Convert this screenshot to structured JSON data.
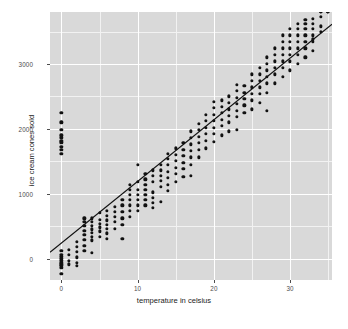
{
  "chart_data": {
    "type": "scatter",
    "title": "",
    "xlabel": "temperature in celsius",
    "ylabel": "ice cream cones sold",
    "xlim": [
      -1.5,
      35.5
    ],
    "ylim": [
      -330,
      3800
    ],
    "xticks": [
      0,
      10,
      20,
      30
    ],
    "xticklabels": [
      "0",
      "10",
      "20",
      "30"
    ],
    "yticks": [
      0,
      1000,
      2000,
      3000
    ],
    "yticklabels": [
      "0",
      "1000",
      "2000",
      "3000"
    ],
    "grid": true,
    "grid_color": "#ffffff",
    "panel_color": "#d9d9d9",
    "point_color": "#111111",
    "legend": "none",
    "fit_line": {
      "type": "linear",
      "color": "#111111",
      "slope": 95,
      "intercept": 240,
      "x_start": -1.5,
      "x_end": 35.5,
      "y_start": 98,
      "y_end": 3612
    },
    "x": [
      0,
      0,
      0,
      0,
      0,
      0,
      0,
      0,
      0,
      0,
      0,
      0,
      0,
      0,
      0,
      0,
      0,
      0,
      0,
      0,
      1,
      1,
      1,
      1,
      2,
      2,
      2,
      2,
      2,
      2,
      3,
      3,
      3,
      3,
      3,
      3,
      3,
      3,
      4,
      4,
      4,
      4,
      4,
      4,
      4,
      4,
      5,
      5,
      5,
      5,
      5,
      5,
      6,
      6,
      6,
      6,
      6,
      6,
      6,
      7,
      7,
      7,
      7,
      7,
      8,
      8,
      8,
      8,
      8,
      8,
      9,
      9,
      9,
      9,
      9,
      9,
      9,
      10,
      10,
      10,
      10,
      10,
      10,
      10,
      11,
      11,
      11,
      11,
      11,
      11,
      11,
      12,
      12,
      12,
      12,
      12,
      12,
      12,
      13,
      13,
      13,
      13,
      13,
      13,
      14,
      14,
      14,
      14,
      14,
      14,
      14,
      15,
      15,
      15,
      15,
      15,
      15,
      16,
      16,
      16,
      16,
      16,
      16,
      17,
      17,
      17,
      17,
      17,
      17,
      17,
      18,
      18,
      18,
      18,
      18,
      18,
      19,
      19,
      19,
      19,
      19,
      19,
      20,
      20,
      20,
      20,
      20,
      20,
      20,
      21,
      21,
      21,
      21,
      21,
      21,
      22,
      22,
      22,
      22,
      22,
      22,
      23,
      23,
      23,
      23,
      23,
      23,
      23,
      24,
      24,
      24,
      24,
      24,
      25,
      25,
      25,
      25,
      25,
      25,
      26,
      26,
      26,
      26,
      26,
      26,
      27,
      27,
      27,
      27,
      27,
      27,
      27,
      28,
      28,
      28,
      28,
      28,
      28,
      29,
      29,
      29,
      29,
      29,
      29,
      29,
      30,
      30,
      30,
      30,
      30,
      30,
      30,
      31,
      31,
      31,
      31,
      31,
      31,
      31,
      32,
      32,
      32,
      32,
      32,
      32,
      32,
      33,
      33,
      33,
      33,
      33,
      33,
      33,
      34,
      34,
      34,
      34,
      34,
      34,
      35,
      35,
      35,
      35
    ],
    "y": [
      -230,
      -140,
      -110,
      -90,
      -60,
      -30,
      0,
      30,
      60,
      120,
      1620,
      1680,
      1720,
      1790,
      1820,
      1860,
      1900,
      1980,
      2100,
      2250,
      -90,
      -30,
      60,
      140,
      -110,
      -60,
      20,
      100,
      180,
      260,
      120,
      200,
      290,
      360,
      430,
      500,
      560,
      620,
      90,
      280,
      340,
      400,
      450,
      510,
      560,
      620,
      340,
      420,
      480,
      540,
      600,
      700,
      300,
      390,
      460,
      520,
      590,
      660,
      740,
      460,
      560,
      640,
      720,
      800,
      300,
      520,
      620,
      720,
      820,
      900,
      640,
      740,
      820,
      900,
      980,
      1060,
      1140,
      730,
      820,
      900,
      980,
      1060,
      1180,
      1450,
      820,
      900,
      980,
      1060,
      1140,
      1220,
      1300,
      780,
      860,
      940,
      1020,
      1180,
      1280,
      1360,
      870,
      1100,
      1200,
      1280,
      1360,
      1440,
      1040,
      1140,
      1240,
      1340,
      1440,
      1540,
      1620,
      1180,
      1300,
      1400,
      1500,
      1600,
      1700,
      1260,
      1380,
      1480,
      1580,
      1680,
      1780,
      1280,
      1440,
      1560,
      1660,
      1760,
      1860,
      1960,
      1560,
      1680,
      1780,
      1880,
      1980,
      2080,
      1700,
      1820,
      1920,
      2020,
      2120,
      2220,
      1800,
      1920,
      2020,
      2120,
      2220,
      2320,
      2420,
      1900,
      2040,
      2140,
      2240,
      2340,
      2440,
      1960,
      2100,
      2200,
      2300,
      2400,
      2500,
      1980,
      2180,
      2280,
      2380,
      2480,
      2580,
      2680,
      2240,
      2360,
      2460,
      2560,
      2660,
      2300,
      2440,
      2540,
      2640,
      2740,
      2840,
      2400,
      2540,
      2640,
      2740,
      2840,
      2940,
      2280,
      2560,
      2700,
      2800,
      2900,
      3000,
      3100,
      2700,
      2840,
      2940,
      3040,
      3140,
      3240,
      2800,
      2940,
      3040,
      3140,
      3240,
      3340,
      3440,
      2900,
      3040,
      3140,
      3240,
      3340,
      3440,
      3540,
      3000,
      3140,
      3240,
      3340,
      3440,
      3540,
      3620,
      3100,
      3240,
      3340,
      3440,
      3540,
      3620,
      3680,
      3200,
      3340,
      3440,
      3540,
      3620,
      3700,
      3380,
      3500,
      3580,
      3720
    ]
  }
}
